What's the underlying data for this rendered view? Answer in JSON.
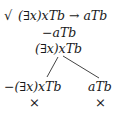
{
  "tree": {
    "root": {
      "check_mark": "√",
      "formula": "(∃x)xTb → aTb",
      "checked": true
    },
    "trunk": [
      {
        "formula": "−aTb"
      },
      {
        "formula": "(∃x)xTb"
      }
    ],
    "branches": [
      {
        "formula": "−(∃x)xTb",
        "closed_mark": "×"
      },
      {
        "formula": "aTb",
        "closed_mark": "×"
      }
    ]
  }
}
